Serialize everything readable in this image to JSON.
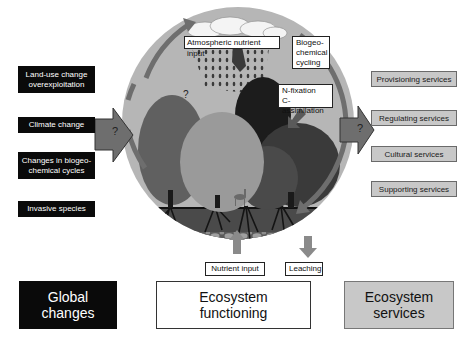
{
  "global_changes": {
    "title": "Global\nchanges",
    "title_line1": "Global",
    "title_line2": "changes",
    "items": [
      {
        "line1": "Land-use change",
        "line2": "overexploitation"
      },
      {
        "line1": "Climate change",
        "line2": ""
      },
      {
        "line1": "Changes in biogeo-",
        "line2": "chemical cycles"
      },
      {
        "line1": "Invasive species",
        "line2": ""
      }
    ],
    "arrow_symbol": "?",
    "color": "#0a0a0a"
  },
  "ecosystem_functioning": {
    "title_line1": "Ecosystem",
    "title_line2": "functioning",
    "labels": {
      "atmospheric": "Atmospheric nutrient input",
      "biogeo_line1": "Biogeo-",
      "biogeo_line2": "chemical",
      "biogeo_line3": "cycling",
      "nfix_line1": "N-fixation",
      "nfix_line2": "C-assimilation",
      "nutrient_input": "Nutrient input",
      "leaching": "Leaching",
      "question": "?"
    },
    "circle_color": "#b4b4b4",
    "arc_color": "#6e6e6e"
  },
  "ecosystem_services": {
    "title_line1": "Ecosystem",
    "title_line2": "services",
    "items": [
      "Provisioning services",
      "Regulating services",
      "Cultural services",
      "Supporting services"
    ],
    "arrow_symbol": "?",
    "color": "#c8c8c8"
  }
}
